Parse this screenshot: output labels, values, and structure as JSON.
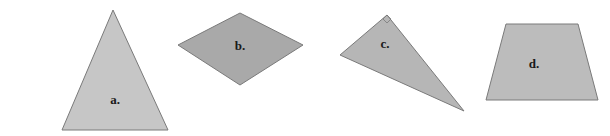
{
  "figure": {
    "background": "#ffffff",
    "stroke_color": "#7a7a7a",
    "shapes": [
      {
        "id": "a",
        "label": "a.",
        "kind": "isosceles-triangle",
        "fill": "#c6c6c6",
        "points": "113,10 62,130 168,130",
        "label_pos": {
          "x": 115,
          "y": 104
        }
      },
      {
        "id": "b",
        "label": "b.",
        "kind": "rhombus",
        "fill": "#a9a9a9",
        "points": "240,13 303,45 240,85 178,45",
        "label_pos": {
          "x": 240,
          "y": 50
        }
      },
      {
        "id": "c",
        "label": "c.",
        "kind": "right-triangle",
        "fill": "#b6b6b6",
        "points": "387,15 340,55 464,111",
        "right_angle_marker": "387,15 391,19 387,23 383,19",
        "label_pos": {
          "x": 385,
          "y": 48
        }
      },
      {
        "id": "d",
        "label": "d.",
        "kind": "trapezoid",
        "fill": "#bcbcbc",
        "points": "506,24 578,24 598,100 486,100",
        "label_pos": {
          "x": 534,
          "y": 68
        }
      }
    ]
  }
}
